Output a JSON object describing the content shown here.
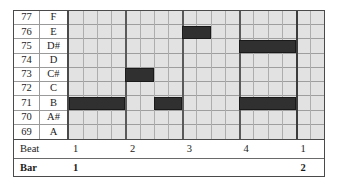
{
  "chart_data": {
    "type": "heatmap",
    "title": "",
    "xlabel": "Beat / Bar",
    "ylabel": "MIDI pitch",
    "grid": true,
    "legend": "none",
    "columns_total": 18,
    "columns_per_bar": 16,
    "subdivisions_per_beat": 4,
    "rows": [
      {
        "midi": "77",
        "name": "F"
      },
      {
        "midi": "76",
        "name": "E"
      },
      {
        "midi": "75",
        "name": "D#"
      },
      {
        "midi": "74",
        "name": "D"
      },
      {
        "midi": "73",
        "name": "C#"
      },
      {
        "midi": "72",
        "name": "C"
      },
      {
        "midi": "71",
        "name": "B"
      },
      {
        "midi": "70",
        "name": "A#"
      },
      {
        "midi": "69",
        "name": "A"
      }
    ],
    "notes": [
      {
        "midi": "76",
        "name": "E",
        "row": 1,
        "start": 8,
        "length": 2
      },
      {
        "midi": "75",
        "name": "D#",
        "row": 2,
        "start": 12,
        "length": 4
      },
      {
        "midi": "73",
        "name": "C#",
        "row": 4,
        "start": 4,
        "length": 2
      },
      {
        "midi": "71",
        "name": "B",
        "row": 6,
        "start": 0,
        "length": 4
      },
      {
        "midi": "71",
        "name": "B",
        "row": 6,
        "start": 6,
        "length": 2
      },
      {
        "midi": "71",
        "name": "B",
        "row": 6,
        "start": 12,
        "length": 4
      }
    ],
    "beat_ticks": [
      {
        "label": "1",
        "col": 0
      },
      {
        "label": "2",
        "col": 4
      },
      {
        "label": "3",
        "col": 8
      },
      {
        "label": "4",
        "col": 12
      },
      {
        "label": "1",
        "col": 16
      }
    ],
    "bar_ticks": [
      {
        "label": "1",
        "col": 0
      },
      {
        "label": "2",
        "col": 16
      }
    ],
    "colors": {
      "note_fill": "#303030",
      "grid_background": "#e2e2e2",
      "grid_line": "#9e9e9e",
      "beat_line": "#5a5a5a",
      "bar_line": "#3c3c3c",
      "frame": "#4a4a4a",
      "text": "#1c1c1c"
    }
  },
  "ruler": {
    "beat_label": "Beat",
    "bar_label": "Bar"
  }
}
